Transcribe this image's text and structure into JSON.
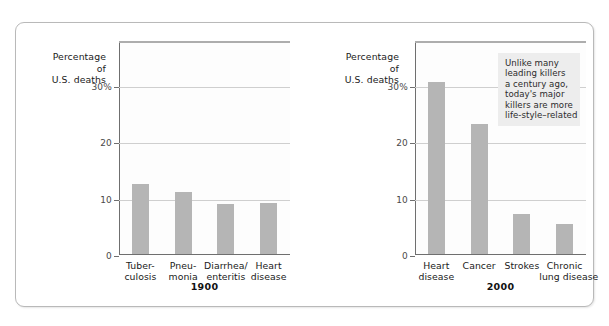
{
  "figure": {
    "axis_caption_lines": [
      "Percentage",
      "of",
      "U.S. deaths"
    ],
    "annotation_lines": [
      "Unlike many",
      "leading killers",
      "a century ago,",
      "today's major",
      "killers are more",
      "life-style–related"
    ],
    "colors": {
      "bar": "#b5b5b5",
      "gridline": "#cfcfcf",
      "axis": "#6f6f6f",
      "plot_background": "#fdfdfd",
      "annotation_background": "#ededed",
      "card_border": "#b9b9b9"
    }
  },
  "chart_data": [
    {
      "type": "bar",
      "title": "1900",
      "xlabel": "",
      "ylabel": "Percentage of U.S. deaths",
      "ylim": [
        0,
        38
      ],
      "yticks": [
        0,
        10,
        20,
        30
      ],
      "ytick_labels": [
        "0",
        "10",
        "20",
        "30%"
      ],
      "grid": true,
      "legend": "none",
      "categories": [
        "Tuber-culosis",
        "Pneu-monia",
        "Diarrhea/enteritis",
        "Heart disease"
      ],
      "category_lines": [
        [
          "Tuber-",
          "culosis"
        ],
        [
          "Pneu-",
          "monia"
        ],
        [
          "Diarrhea/",
          "enteritis"
        ],
        [
          "Heart",
          "disease"
        ]
      ],
      "values": [
        12.5,
        11.0,
        8.8,
        9.0
      ]
    },
    {
      "type": "bar",
      "title": "2000",
      "xlabel": "",
      "ylabel": "Percentage of U.S. deaths",
      "ylim": [
        0,
        38
      ],
      "yticks": [
        0,
        10,
        20,
        30
      ],
      "ytick_labels": [
        "0",
        "10",
        "20",
        "30%"
      ],
      "grid": true,
      "legend": "none",
      "annotation": "Unlike many leading killers a century ago, today's major killers are more life-style–related",
      "categories": [
        "Heart disease",
        "Cancer",
        "Strokes",
        "Chronic lung disease"
      ],
      "category_lines": [
        [
          "Heart",
          "disease"
        ],
        [
          "Cancer"
        ],
        [
          "Strokes"
        ],
        [
          "Chronic",
          "lung disease"
        ]
      ],
      "values": [
        30.5,
        23.0,
        7.1,
        5.3
      ]
    }
  ]
}
